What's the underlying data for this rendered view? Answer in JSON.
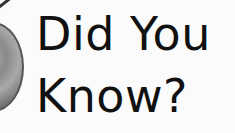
{
  "heading": {
    "line1": "Did You",
    "line2": "Know?"
  },
  "graphic": {
    "icon": "magnifying-glass-icon"
  },
  "colors": {
    "text": "#111111",
    "background": "#fbfbfb",
    "lens": "#8a8a8a",
    "handle": "#333333"
  }
}
